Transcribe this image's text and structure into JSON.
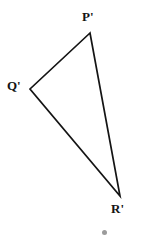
{
  "figure": {
    "background_color": "#ffffff",
    "stroke_color": "#141414",
    "stroke_width": 1.7,
    "dot_color": "#8a8a8a"
  },
  "labels": {
    "p": "P'",
    "q": "Q'",
    "r": "R'"
  },
  "chart_data": {
    "type": "scatter",
    "xlabel": "",
    "ylabel": "",
    "grid": false,
    "legend": "none",
    "shape": "triangle",
    "closed": true,
    "vertices": [
      {
        "name": "P'",
        "x": 90,
        "y": 33
      },
      {
        "name": "Q'",
        "x": 30,
        "y": 89
      },
      {
        "name": "R'",
        "x": 120,
        "y": 196
      }
    ],
    "edges": [
      {
        "from": "P'",
        "to": "Q'"
      },
      {
        "from": "Q'",
        "to": "R'"
      },
      {
        "from": "R'",
        "to": "P'"
      }
    ],
    "annotations": [
      {
        "kind": "dot",
        "x": 104,
        "y": 233,
        "radius": 2.5
      }
    ],
    "polygon_points": "90,33 30,89 120,196"
  }
}
